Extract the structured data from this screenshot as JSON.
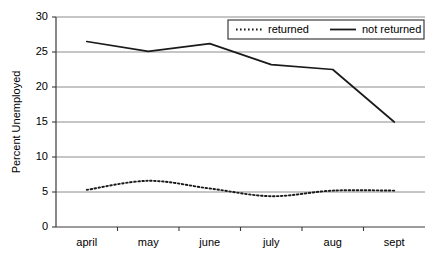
{
  "chart_data": {
    "type": "line",
    "title": "",
    "xlabel": "",
    "ylabel": "Percent Unemployed",
    "categories": [
      "april",
      "may",
      "june",
      "july",
      "aug",
      "sept"
    ],
    "ylim": [
      0,
      30
    ],
    "yticks": [
      0,
      5,
      10,
      15,
      20,
      25,
      30
    ],
    "grid": "horizontal",
    "legend_position": "top-right",
    "series": [
      {
        "name": "returned",
        "style": "dotted",
        "color": "#1a1a1a",
        "values": [
          5.3,
          6.6,
          5.5,
          4.4,
          5.2,
          5.2
        ]
      },
      {
        "name": "not returned",
        "style": "solid",
        "color": "#1a1a1a",
        "values": [
          26.5,
          25.1,
          26.2,
          23.2,
          22.5,
          15.0
        ]
      }
    ]
  },
  "axes": {
    "y_tick_labels": [
      "0",
      "5",
      "10",
      "15",
      "20",
      "25",
      "30"
    ],
    "x_tick_labels": [
      "april",
      "may",
      "june",
      "july",
      "aug",
      "sept"
    ],
    "y_axis_title": "Percent Unemployed"
  },
  "legend": {
    "entries": [
      {
        "label": "returned",
        "style": "dotted"
      },
      {
        "label": "not returned",
        "style": "solid"
      }
    ]
  }
}
